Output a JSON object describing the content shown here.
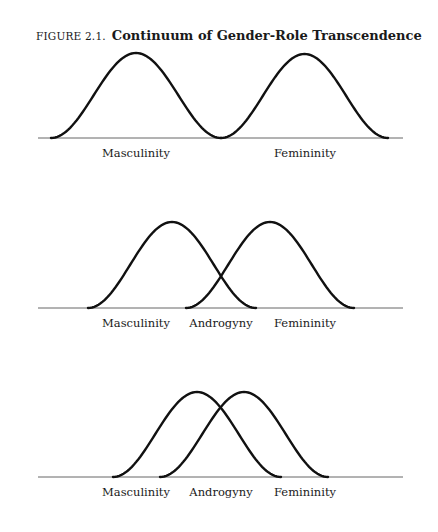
{
  "figure": {
    "number": "FIGURE 2.1.",
    "title": "Continuum of Gender-Role Transcendence"
  },
  "chart_data": [
    {
      "type": "line",
      "title": "Continuum of Gender-Role Transcendence — Panel 1",
      "baseline_y": 138,
      "axis": [
        38,
        403
      ],
      "series": [
        {
          "name": "Masculinity",
          "start": 51,
          "end": 221,
          "peak_x": 138,
          "peak_y": 53
        },
        {
          "name": "Femininity",
          "start": 221,
          "end": 388,
          "peak_x": 306,
          "peak_y": 54
        }
      ],
      "labels": [
        {
          "text": "Masculinity",
          "x": 136
        },
        {
          "text": "Femininity",
          "x": 305
        }
      ]
    },
    {
      "type": "line",
      "title": "Continuum of Gender-Role Transcendence — Panel 2",
      "baseline_y": 308,
      "axis": [
        38,
        403
      ],
      "series": [
        {
          "name": "Masculinity",
          "start": 88,
          "end": 256,
          "peak_x": 172,
          "peak_y": 222
        },
        {
          "name": "Femininity",
          "start": 186,
          "end": 354,
          "peak_x": 270,
          "peak_y": 222
        }
      ],
      "labels": [
        {
          "text": "Masculinity",
          "x": 136
        },
        {
          "text": "Androgyny",
          "x": 221
        },
        {
          "text": "Femininity",
          "x": 305
        }
      ]
    },
    {
      "type": "line",
      "title": "Continuum of Gender-Role Transcendence — Panel 3",
      "baseline_y": 477,
      "axis": [
        38,
        403
      ],
      "series": [
        {
          "name": "Masculinity",
          "start": 113,
          "end": 281,
          "peak_x": 197,
          "peak_y": 392
        },
        {
          "name": "Femininity",
          "start": 160,
          "end": 328,
          "peak_x": 243,
          "peak_y": 392
        }
      ],
      "labels": [
        {
          "text": "Masculinity",
          "x": 136
        },
        {
          "text": "Androgyny",
          "x": 221
        },
        {
          "text": "Femininity",
          "x": 305
        }
      ]
    }
  ]
}
